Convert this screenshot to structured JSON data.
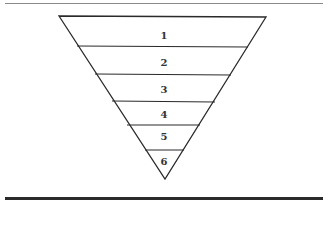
{
  "diagram": {
    "type": "inverted-pyramid",
    "levels": [
      {
        "label": "1"
      },
      {
        "label": "2"
      },
      {
        "label": "3"
      },
      {
        "label": "4"
      },
      {
        "label": "5"
      },
      {
        "label": "6"
      }
    ],
    "colors": {
      "stroke": "#2a2a2a",
      "text": "#333333",
      "background": "#ffffff"
    }
  }
}
